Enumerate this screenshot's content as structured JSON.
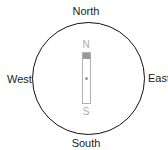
{
  "compass": {
    "directions": {
      "north": "North",
      "south": "South",
      "east": "East",
      "west": "West"
    },
    "needle": {
      "north_label": "N",
      "south_label": "S"
    }
  },
  "colors": {
    "dial_border": "#111111",
    "label_text": "#222222",
    "needle_border": "#b0b0b0",
    "needle_cap": "#999999",
    "needle_labels": "#aaaaaa"
  }
}
